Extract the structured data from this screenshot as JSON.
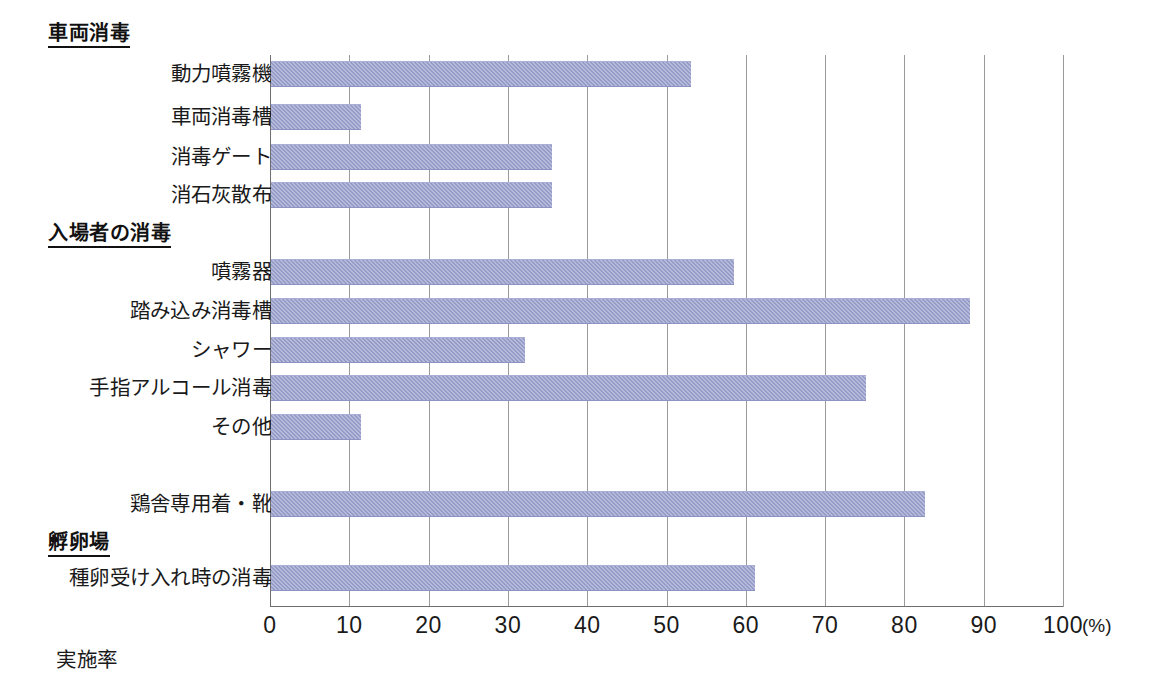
{
  "chart_data": {
    "type": "bar",
    "orientation": "horizontal",
    "title": "",
    "xlabel": "実施率",
    "ylabel": "",
    "unit": "(%)",
    "xlim": [
      0,
      100
    ],
    "xticks": [
      0,
      10,
      20,
      30,
      40,
      50,
      60,
      70,
      80,
      90,
      100
    ],
    "xticklabels": [
      "0",
      "10",
      "20",
      "30",
      "40",
      "50",
      "60",
      "70",
      "80",
      "90",
      "100"
    ],
    "grid": "vertical",
    "legend": "none",
    "bar_color": "#959cc9",
    "groups": [
      {
        "header": "車両消毒",
        "categories": [
          "動力噴霧機",
          "車両消毒槽",
          "消毒ゲート",
          "消石灰散布"
        ],
        "values": [
          53.0,
          11.4,
          35.4,
          35.4
        ]
      },
      {
        "header": "入場者の消毒",
        "categories": [
          "噴霧器",
          "踏み込み消毒槽",
          "シャワー",
          "手指アルコール消毒",
          "その他"
        ],
        "values": [
          58.4,
          88.2,
          32.0,
          75.0,
          11.4
        ]
      },
      {
        "header": "",
        "categories": [
          "鶏舎専用着・靴"
        ],
        "values": [
          82.5
        ]
      },
      {
        "header": "孵卵場",
        "categories": [
          "種卵受け入れ時の消毒"
        ],
        "values": [
          61.0
        ]
      }
    ],
    "categories": [
      "動力噴霧機",
      "車両消毒槽",
      "消毒ゲート",
      "消石灰散布",
      "噴霧器",
      "踏み込み消毒槽",
      "シャワー",
      "手指アルコール消毒",
      "その他",
      "鶏舎専用着・靴",
      "種卵受け入れ時の消毒"
    ],
    "values": [
      53.0,
      11.4,
      35.4,
      35.4,
      58.4,
      88.2,
      32.0,
      75.0,
      11.4,
      82.5,
      61.0
    ]
  },
  "layout": {
    "rows": [
      {
        "kind": "header",
        "text": "車両消毒",
        "top": 22
      },
      {
        "kind": "bar",
        "cat": "動力噴霧機",
        "value": 53.0,
        "top": 57
      },
      {
        "kind": "bar",
        "cat": "車両消毒槽",
        "value": 11.4,
        "top": 100
      },
      {
        "kind": "bar",
        "cat": "消毒ゲート",
        "value": 35.4,
        "top": 140
      },
      {
        "kind": "bar",
        "cat": "消石灰散布",
        "value": 35.4,
        "top": 178
      },
      {
        "kind": "header",
        "text": "入場者の消毒",
        "top": 222
      },
      {
        "kind": "bar",
        "cat": "噴霧器",
        "value": 58.4,
        "top": 255
      },
      {
        "kind": "bar",
        "cat": "踏み込み消毒槽",
        "value": 88.2,
        "top": 294
      },
      {
        "kind": "bar",
        "cat": "シャワー",
        "value": 32.0,
        "top": 333
      },
      {
        "kind": "bar",
        "cat": "手指アルコール消毒",
        "value": 75.0,
        "top": 371
      },
      {
        "kind": "bar",
        "cat": "その他",
        "value": 11.4,
        "top": 410
      },
      {
        "kind": "bar",
        "cat": "鶏舎専用着・靴",
        "value": 82.5,
        "top": 487
      },
      {
        "kind": "header",
        "text": "孵卵場",
        "top": 531
      },
      {
        "kind": "bar",
        "cat": "種卵受け入れ時の消毒",
        "value": 61.0,
        "top": 561
      }
    ]
  }
}
